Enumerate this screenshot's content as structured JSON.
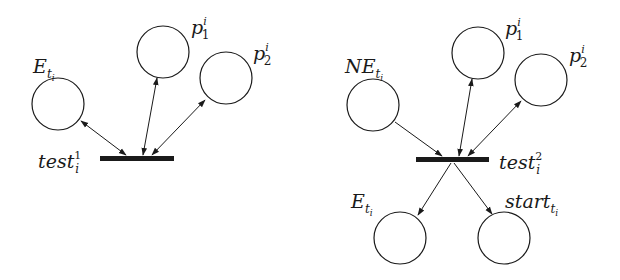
{
  "diagrams": [
    {
      "name": "left",
      "transition": {
        "label": "test",
        "sub": "i",
        "sup": "1"
      },
      "places": [
        {
          "id": "E",
          "label": "E",
          "sub": "t",
          "subsub": "i"
        },
        {
          "id": "p1",
          "label": "p",
          "sub": "1",
          "sup": "i"
        },
        {
          "id": "p2",
          "label": "p",
          "sub": "2",
          "sup": "i"
        }
      ],
      "arcs": [
        {
          "from": "E",
          "to": "test1",
          "type": "bidirectional"
        },
        {
          "from": "p1",
          "to": "test1",
          "type": "bidirectional"
        },
        {
          "from": "p2",
          "to": "test1",
          "type": "bidirectional"
        }
      ]
    },
    {
      "name": "right",
      "transition": {
        "label": "test",
        "sub": "i",
        "sup": "2"
      },
      "places": [
        {
          "id": "NE",
          "label": "NE",
          "sub": "t",
          "subsub": "i"
        },
        {
          "id": "p1",
          "label": "p",
          "sub": "1",
          "sup": "i"
        },
        {
          "id": "p2",
          "label": "p",
          "sub": "2",
          "sup": "i"
        },
        {
          "id": "E",
          "label": "E",
          "sub": "t",
          "subsub": "i"
        },
        {
          "id": "start",
          "label": "start",
          "sub": "t",
          "subsub": "i"
        }
      ],
      "arcs": [
        {
          "from": "NE",
          "to": "test2",
          "type": "input"
        },
        {
          "from": "p1",
          "to": "test2",
          "type": "bidirectional"
        },
        {
          "from": "p2",
          "to": "test2",
          "type": "bidirectional"
        },
        {
          "from": "test2",
          "to": "E",
          "type": "output"
        },
        {
          "from": "test2",
          "to": "start",
          "type": "output"
        }
      ]
    }
  ],
  "colors": {
    "stroke": "#1a1a1a",
    "background": "#ffffff"
  }
}
